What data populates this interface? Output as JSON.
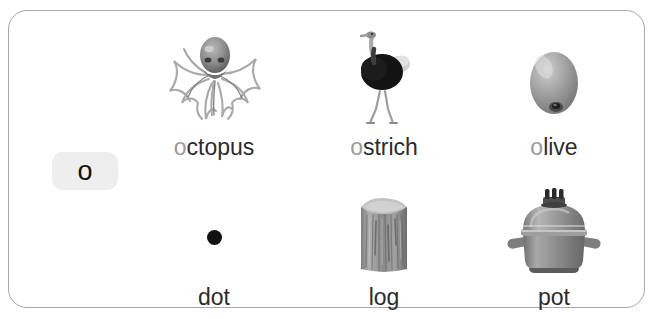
{
  "card": {
    "letter_badge": {
      "letter": "o",
      "background_color": "#eeeeee",
      "text_color": "#111111"
    },
    "highlight_color": "#9a9a9a",
    "text_color": "#2b2b2b",
    "border_color": "#a8a8a8",
    "background_color": "#ffffff"
  },
  "rows": [
    {
      "row": 1,
      "items": [
        {
          "word": "octopus",
          "highlighted_prefix": "o",
          "rest": "ctopus",
          "image": "octopus-image"
        },
        {
          "word": "ostrich",
          "highlighted_prefix": "o",
          "rest": "strich",
          "image": "ostrich-image"
        },
        {
          "word": "olive",
          "highlighted_prefix": "o",
          "rest": "live",
          "image": "olive-image"
        }
      ]
    },
    {
      "row": 2,
      "items": [
        {
          "word": "dot",
          "highlighted_prefix": "",
          "rest": "dot",
          "image": "dot-image"
        },
        {
          "word": "log",
          "highlighted_prefix": "",
          "rest": "log",
          "image": "log-image"
        },
        {
          "word": "pot",
          "highlighted_prefix": "",
          "rest": "pot",
          "image": "pot-image"
        }
      ]
    }
  ]
}
